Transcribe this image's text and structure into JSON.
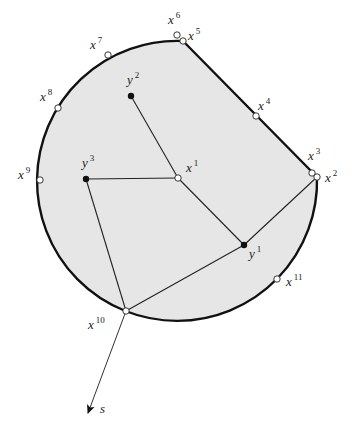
{
  "diagram": {
    "region": {
      "fill": "#e6e6e6",
      "stroke": "#111111",
      "circle_center": [
        178,
        180
      ],
      "circle_radius": 140,
      "chord_start": [
        183,
        41
      ],
      "chord_end": [
        317,
        177
      ]
    },
    "boundary_points": [
      {
        "id": "x1",
        "base": "x",
        "sup": "1",
        "pos": [
          178,
          178
        ],
        "label_pos": [
          186,
          172
        ],
        "kind": "open"
      },
      {
        "id": "x2",
        "base": "x",
        "sup": "2",
        "pos": [
          317,
          177
        ],
        "label_pos": [
          325,
          182
        ],
        "kind": "open"
      },
      {
        "id": "x3",
        "base": "x",
        "sup": "3",
        "pos": [
          312,
          173
        ],
        "label_pos": [
          308,
          160
        ],
        "kind": "open"
      },
      {
        "id": "x4",
        "base": "x",
        "sup": "4",
        "pos": [
          256,
          116
        ],
        "label_pos": [
          258,
          110
        ],
        "kind": "open"
      },
      {
        "id": "x5",
        "base": "x",
        "sup": "5",
        "pos": [
          183,
          41
        ],
        "label_pos": [
          188,
          40
        ],
        "kind": "open"
      },
      {
        "id": "x6",
        "base": "x",
        "sup": "6",
        "pos": [
          177,
          35
        ],
        "label_pos": [
          168,
          24
        ],
        "kind": "open"
      },
      {
        "id": "x7",
        "base": "x",
        "sup": "7",
        "pos": [
          108,
          55
        ],
        "label_pos": [
          90,
          49
        ],
        "kind": "open"
      },
      {
        "id": "x8",
        "base": "x",
        "sup": "8",
        "pos": [
          58,
          108
        ],
        "label_pos": [
          40,
          101
        ],
        "kind": "open"
      },
      {
        "id": "x9",
        "base": "x",
        "sup": "9",
        "pos": [
          40,
          180
        ],
        "label_pos": [
          18,
          179
        ],
        "kind": "open"
      },
      {
        "id": "x10",
        "base": "x",
        "sup": "10",
        "pos": [
          126,
          311
        ],
        "label_pos": [
          88,
          329
        ],
        "kind": "open"
      },
      {
        "id": "x11",
        "base": "x",
        "sup": "11",
        "pos": [
          277,
          279
        ],
        "label_pos": [
          286,
          286
        ],
        "kind": "open"
      }
    ],
    "interior_points": [
      {
        "id": "y1",
        "base": "y",
        "sup": "1",
        "pos": [
          244,
          245
        ],
        "label_pos": [
          249,
          258
        ],
        "kind": "filled"
      },
      {
        "id": "y2",
        "base": "y",
        "sup": "2",
        "pos": [
          131,
          96
        ],
        "label_pos": [
          127,
          84
        ],
        "kind": "filled"
      },
      {
        "id": "y3",
        "base": "y",
        "sup": "3",
        "pos": [
          86,
          179
        ],
        "label_pos": [
          82,
          167
        ],
        "kind": "filled"
      }
    ],
    "edges": [
      {
        "from": [
          131,
          96
        ],
        "to": [
          178,
          178
        ]
      },
      {
        "from": [
          86,
          179
        ],
        "to": [
          178,
          178
        ]
      },
      {
        "from": [
          178,
          178
        ],
        "to": [
          244,
          245
        ]
      },
      {
        "from": [
          244,
          245
        ],
        "to": [
          317,
          177
        ]
      },
      {
        "from": [
          86,
          179
        ],
        "to": [
          126,
          311
        ]
      },
      {
        "from": [
          126,
          311
        ],
        "to": [
          244,
          245
        ]
      }
    ],
    "arrow": {
      "from": [
        126,
        311
      ],
      "to": [
        88,
        413
      ],
      "label": "s",
      "label_pos": [
        100,
        413
      ]
    }
  }
}
